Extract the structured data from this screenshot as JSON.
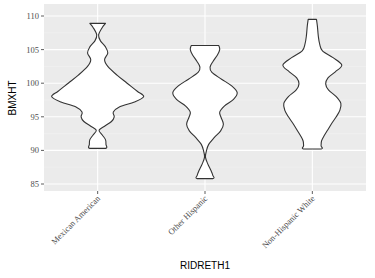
{
  "chart_data": {
    "type": "violin",
    "title": "",
    "xlabel": "RIDRETH1",
    "ylabel": "BMXHT",
    "categories": [
      "Mexican American",
      "Other Hispanic",
      "Non-Hispanic White"
    ],
    "ylim": [
      84.5,
      111
    ],
    "yticks": [
      85,
      90,
      95,
      100,
      105,
      110
    ],
    "ytick_labels": [
      "85",
      "90",
      "95",
      "100",
      "105",
      "110"
    ],
    "grid": true,
    "legend": "none",
    "series": [
      {
        "name": "Mexican American",
        "min": 90.3,
        "max": 108.9,
        "profile": [
          [
            108.9,
            0.17
          ],
          [
            108.3,
            0.1
          ],
          [
            107.2,
            0.02
          ],
          [
            106.3,
            0.06
          ],
          [
            105.4,
            0.17
          ],
          [
            104.5,
            0.22
          ],
          [
            103.5,
            0.15
          ],
          [
            102.5,
            0.22
          ],
          [
            101.2,
            0.42
          ],
          [
            100.0,
            0.64
          ],
          [
            98.8,
            0.86
          ],
          [
            98.0,
            1.0
          ],
          [
            97.2,
            0.8
          ],
          [
            96.5,
            0.48
          ],
          [
            95.7,
            0.34
          ],
          [
            95.0,
            0.36
          ],
          [
            94.3,
            0.3
          ],
          [
            93.6,
            0.15
          ],
          [
            93.0,
            0.03
          ],
          [
            92.3,
            0.1
          ],
          [
            91.6,
            0.17
          ],
          [
            90.9,
            0.18
          ],
          [
            90.3,
            0.17
          ]
        ]
      },
      {
        "name": "Other Hispanic",
        "min": 85.8,
        "max": 105.6,
        "profile": [
          [
            105.6,
            0.3
          ],
          [
            105.0,
            0.32
          ],
          [
            104.2,
            0.27
          ],
          [
            103.3,
            0.18
          ],
          [
            102.4,
            0.11
          ],
          [
            101.6,
            0.15
          ],
          [
            100.6,
            0.36
          ],
          [
            99.6,
            0.58
          ],
          [
            98.6,
            0.7
          ],
          [
            97.6,
            0.62
          ],
          [
            96.6,
            0.42
          ],
          [
            95.7,
            0.32
          ],
          [
            94.9,
            0.35
          ],
          [
            93.9,
            0.4
          ],
          [
            92.9,
            0.34
          ],
          [
            91.9,
            0.2
          ],
          [
            90.9,
            0.08
          ],
          [
            89.9,
            0.03
          ],
          [
            89.0,
            0.01
          ],
          [
            88.0,
            0.06
          ],
          [
            87.0,
            0.13
          ],
          [
            86.3,
            0.17
          ],
          [
            85.8,
            0.17
          ]
        ]
      },
      {
        "name": "Non-Hispanic White",
        "min": 90.2,
        "max": 109.5,
        "profile": [
          [
            109.5,
            0.09
          ],
          [
            108.5,
            0.11
          ],
          [
            107.0,
            0.13
          ],
          [
            105.8,
            0.16
          ],
          [
            104.8,
            0.22
          ],
          [
            103.8,
            0.45
          ],
          [
            102.7,
            0.64
          ],
          [
            101.7,
            0.5
          ],
          [
            100.8,
            0.34
          ],
          [
            99.9,
            0.29
          ],
          [
            99.0,
            0.35
          ],
          [
            98.0,
            0.52
          ],
          [
            97.0,
            0.62
          ],
          [
            96.0,
            0.6
          ],
          [
            95.0,
            0.52
          ],
          [
            94.0,
            0.42
          ],
          [
            93.0,
            0.33
          ],
          [
            92.1,
            0.25
          ],
          [
            91.4,
            0.2
          ],
          [
            90.7,
            0.19
          ],
          [
            90.2,
            0.19
          ]
        ]
      }
    ],
    "colors": {
      "panel_background": "#ebebeb",
      "grid_major": "#ffffff",
      "grid_minor": "#f2f2f2",
      "violin_fill": "#ffffff",
      "violin_stroke": "#333333",
      "tick_mark": "#333333",
      "tick_label": "#4d4d4d"
    }
  }
}
